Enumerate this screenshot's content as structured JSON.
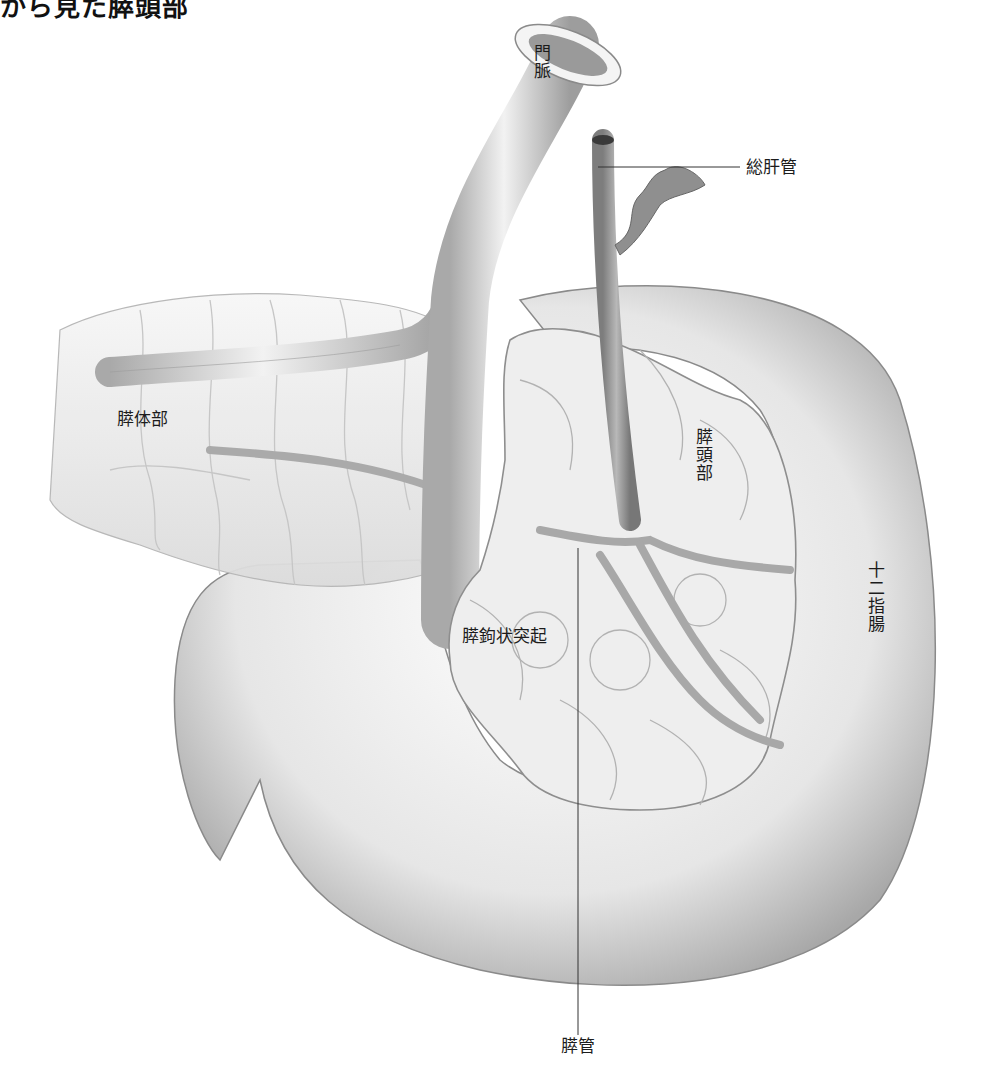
{
  "title": "から見た膵頭部",
  "labels": {
    "portal_vein": "門脈",
    "common_hepatic_duct": "総肝管",
    "pancreas_body": "膵体部",
    "pancreas_head": "膵頭部",
    "duodenum": "十二指腸",
    "uncinate_process": "膵鉤状突起",
    "pancreatic_duct": "膵管"
  },
  "colors": {
    "background": "#ffffff",
    "organ_fill": "#e9e9e9",
    "organ_shadow": "#9a9a9a",
    "vessel": "#bdbdbd",
    "duct": "#8c8c8c",
    "leader_line": "#333333",
    "text": "#1c1c1c"
  }
}
